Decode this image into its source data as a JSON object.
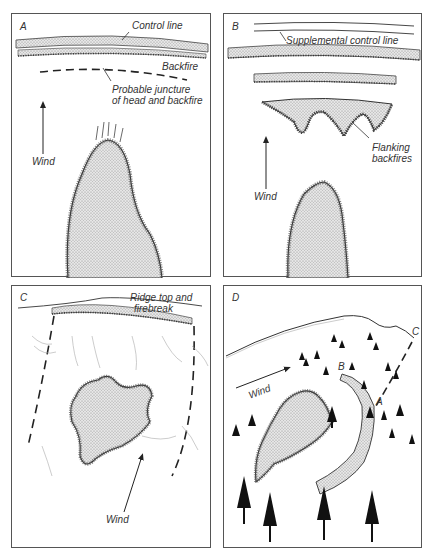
{
  "panels": [
    {
      "id": "A",
      "label": "A",
      "annotations": {
        "control_line": "Control line",
        "backfire": "Backfire",
        "juncture_1": "Probable juncture",
        "juncture_2": "of head and backfire",
        "wind": "Wind"
      }
    },
    {
      "id": "B",
      "label": "B",
      "annotations": {
        "supplemental": "Supplemental control line",
        "flanking_1": "Flanking",
        "flanking_2": "backfires",
        "wind": "Wind"
      }
    },
    {
      "id": "C",
      "label": "C",
      "annotations": {
        "ridge_1": "Ridge top and",
        "ridge_2": "firebreak",
        "wind": "Wind"
      }
    },
    {
      "id": "D",
      "label": "D",
      "annotations": {
        "wind": "Wind",
        "point_a": "A",
        "point_b": "B",
        "point_c": "C"
      }
    }
  ],
  "colors": {
    "line": "#333333",
    "fire_fill": "#d9d9d9",
    "frame": "#555555"
  }
}
